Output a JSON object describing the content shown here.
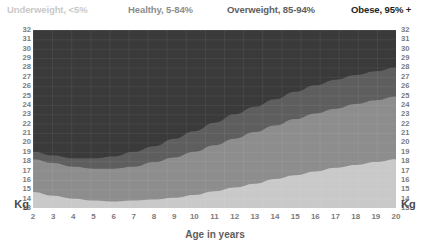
{
  "legend": {
    "items": [
      {
        "label": "Underweight, <5%",
        "color": "#c9c9c9"
      },
      {
        "label": "Healthy, 5-84%",
        "color": "#8d8d8d"
      },
      {
        "label": "Overweight, 85-94%",
        "color": "#5e5e5e"
      },
      {
        "label": "Obese, 95% +",
        "color": "#231f20"
      }
    ]
  },
  "axes": {
    "y_unit_left": "Kg",
    "y_unit_right": "Kg",
    "x_title": "Age in years"
  },
  "chart_data": {
    "type": "area",
    "title": "",
    "subtitle": "",
    "xlabel": "Age in years",
    "ylabel": "Kg",
    "xlim": [
      2,
      20
    ],
    "ylim": [
      13,
      32
    ],
    "grid": true,
    "legend_position": "top",
    "x_ticks": [
      2,
      3,
      4,
      5,
      6,
      7,
      8,
      9,
      10,
      11,
      12,
      13,
      14,
      15,
      16,
      17,
      18,
      19,
      20
    ],
    "y_ticks": [
      32,
      31,
      30,
      29,
      28,
      27,
      26,
      25,
      24,
      23,
      22,
      21,
      20,
      19,
      18,
      17,
      16,
      15,
      14,
      13
    ],
    "x": [
      2,
      3,
      4,
      5,
      6,
      7,
      8,
      9,
      10,
      11,
      12,
      13,
      14,
      15,
      16,
      17,
      18,
      19,
      20
    ],
    "series": [
      {
        "name": "Underweight, <5%",
        "color": "#c9c9c9",
        "description": "Region below the 5th percentile curve",
        "upper_bound_values": [
          14.7,
          14.3,
          14.0,
          13.8,
          13.7,
          13.8,
          13.9,
          14.1,
          14.4,
          14.8,
          15.2,
          15.6,
          16.1,
          16.5,
          16.9,
          17.3,
          17.6,
          17.9,
          18.2
        ]
      },
      {
        "name": "Healthy, 5-84%",
        "color": "#8d8d8d",
        "description": "Region between the 5th and 85th percentile curves",
        "upper_bound_values": [
          18.2,
          17.8,
          17.4,
          17.2,
          17.2,
          17.4,
          17.9,
          18.4,
          19.0,
          19.7,
          20.4,
          21.1,
          21.8,
          22.5,
          23.1,
          23.6,
          24.1,
          24.5,
          24.9
        ]
      },
      {
        "name": "Overweight, 85-94%",
        "color": "#5e5e5e",
        "description": "Region between the 85th and 95th percentile curves",
        "upper_bound_values": [
          19.0,
          18.6,
          18.3,
          18.3,
          18.5,
          19.0,
          19.6,
          20.4,
          21.2,
          22.1,
          23.0,
          23.8,
          24.6,
          25.4,
          26.1,
          26.7,
          27.2,
          27.6,
          28.0
        ]
      },
      {
        "name": "Obese, 95% +",
        "color": "#3a3a3a",
        "description": "Region above the 95th percentile curve, extending to the top of the plot",
        "upper_bound_values": [
          32,
          32,
          32,
          32,
          32,
          32,
          32,
          32,
          32,
          32,
          32,
          32,
          32,
          32,
          32,
          32,
          32,
          32,
          32
        ]
      }
    ]
  }
}
